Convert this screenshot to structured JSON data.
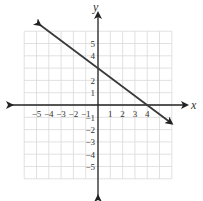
{
  "chart_data": {
    "type": "line",
    "title": "",
    "xlabel": "x",
    "ylabel": "y",
    "xlim": [
      -6,
      6
    ],
    "ylim": [
      -6,
      6
    ],
    "grid": true,
    "x_ticks": [
      -5,
      -4,
      -3,
      -2,
      -1,
      1,
      2,
      3,
      4
    ],
    "y_ticks": [
      5,
      4,
      2,
      1,
      -1,
      -2,
      -3,
      -4,
      -5
    ],
    "x_tick_labels": [
      "−5",
      "−4",
      "−3",
      "−2",
      "−1",
      "1",
      "2",
      "3",
      "4"
    ],
    "y_tick_labels": [
      "5",
      "4",
      "2",
      "1",
      "−1",
      "−2",
      "−3",
      "−4",
      "−5"
    ],
    "series": [
      {
        "name": "line",
        "equation": "y = -3/4 x + 3",
        "slope": -0.75,
        "y_intercept": 3,
        "x_intercept": 4,
        "x": [
          -4.7,
          6
        ],
        "y": [
          6.5,
          -1.5
        ],
        "arrows": "both"
      }
    ],
    "legend": null
  },
  "labels": {
    "x_axis": "x",
    "y_axis": "y"
  },
  "colors": {
    "grid": "#d9d9d9",
    "axis": "#222222",
    "line": "#3a3a3a"
  }
}
